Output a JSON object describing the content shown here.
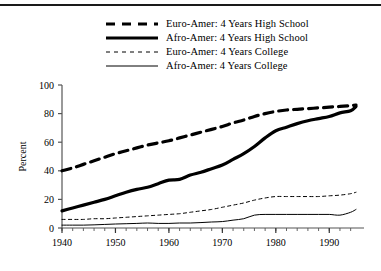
{
  "figure": {
    "has_top_rule": true,
    "background": "#ffffff",
    "ink": "#000000"
  },
  "legend": {
    "position": "top-center",
    "entries": [
      {
        "label": "Euro-Amer: 4 Years High School",
        "key": "thick-dashed",
        "icon": "legend-line-thick-dashed"
      },
      {
        "label": "Afro-Amer: 4 Years High School",
        "key": "thick-solid",
        "icon": "legend-line-thick-solid"
      },
      {
        "label": "Euro-Amer: 4 Years College",
        "key": "thin-dashed",
        "icon": "legend-line-thin-dashed"
      },
      {
        "label": "Afro-Amer: 4 Years College",
        "key": "thin-solid",
        "icon": "legend-line-thin-solid"
      }
    ]
  },
  "axes": {
    "ylabel": "Percent",
    "xlabel": "",
    "yticks": [
      0,
      20,
      40,
      60,
      80,
      100
    ],
    "ytick_labels": [
      "0",
      "20",
      "40",
      "60",
      "80",
      "100"
    ],
    "xticks": [
      1940,
      1950,
      1960,
      1970,
      1980,
      1990
    ],
    "xtick_labels": [
      "1940",
      "1950",
      "1960",
      "1970",
      "1980",
      "1990"
    ],
    "xlim": [
      1940,
      1995
    ],
    "ylim": [
      0,
      100
    ],
    "grid": false,
    "minor_xticks_every": 2
  },
  "chart_data": {
    "type": "line",
    "title": "",
    "xlabel": "",
    "ylabel": "Percent",
    "xlim": [
      1940,
      1995
    ],
    "ylim": [
      0,
      100
    ],
    "grid": false,
    "legend_position": "top-center",
    "x": [
      1940,
      1942,
      1944,
      1946,
      1948,
      1950,
      1952,
      1954,
      1956,
      1958,
      1960,
      1962,
      1964,
      1966,
      1968,
      1970,
      1972,
      1974,
      1976,
      1978,
      1980,
      1982,
      1984,
      1986,
      1988,
      1990,
      1992,
      1994,
      1995
    ],
    "series": [
      {
        "name": "Euro-Amer: 4 Years High School",
        "style": "thick-dashed",
        "values": [
          40,
          42,
          44.5,
          47,
          49.5,
          52,
          54,
          56,
          58,
          59.5,
          61,
          63,
          65,
          67,
          69,
          71,
          73.5,
          75.5,
          78,
          80,
          81.5,
          82.5,
          83,
          83.5,
          84,
          84.5,
          85,
          85.5,
          86
        ]
      },
      {
        "name": "Afro-Amer: 4 Years High School",
        "style": "thick-solid",
        "values": [
          12,
          14,
          16,
          18,
          20,
          22.5,
          25,
          27,
          28.5,
          31,
          33.5,
          34,
          37,
          39,
          41.5,
          44,
          48,
          52,
          57,
          63,
          68,
          70.5,
          73,
          75,
          76.5,
          78,
          80.5,
          82,
          85
        ]
      },
      {
        "name": "Euro-Amer: 4 Years College",
        "style": "thin-dashed",
        "values": [
          6,
          6,
          6,
          6.5,
          6.5,
          7,
          7.5,
          8,
          8.5,
          9,
          9.5,
          10,
          11,
          12,
          13,
          14.5,
          16,
          17.5,
          19.5,
          21,
          22,
          22,
          22,
          22,
          22,
          22.5,
          23,
          24,
          25
        ]
      },
      {
        "name": "Afro-Amer: 4 Years College",
        "style": "thin-solid",
        "values": [
          2,
          2,
          2,
          2.2,
          2.5,
          2.8,
          3,
          3.2,
          3.5,
          3.2,
          3.2,
          3.5,
          3.5,
          3.8,
          4.2,
          4.5,
          5.5,
          6.5,
          9,
          9.5,
          9.5,
          9.5,
          9.5,
          9.5,
          9.5,
          9.5,
          9,
          11,
          13
        ]
      }
    ]
  }
}
